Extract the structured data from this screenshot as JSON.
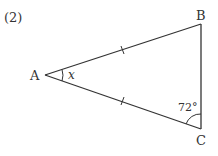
{
  "problem_number": "(2)",
  "vertices": {
    "A": "A",
    "B": "B",
    "C": "C"
  },
  "angle_labels": {
    "at_A": "x",
    "at_C": "72°"
  },
  "equal_marks": [
    "AB",
    "AC"
  ],
  "colors": {
    "line": "#333333",
    "text": "#333333"
  }
}
